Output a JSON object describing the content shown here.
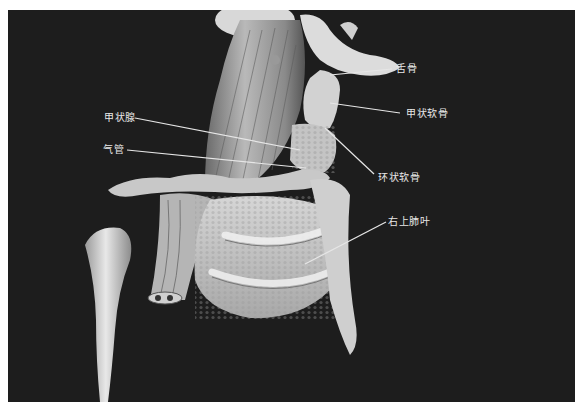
{
  "figure": {
    "background": "#1d1d1d",
    "labels": [
      {
        "id": "hyoid",
        "text": "舌骨"
      },
      {
        "id": "thyroid-cartilage",
        "text": "甲状软骨"
      },
      {
        "id": "cricoid-cartilage",
        "text": "环状软骨"
      },
      {
        "id": "right-upper-lobe",
        "text": "右上肺叶"
      },
      {
        "id": "thyroid-gland",
        "text": "甲状腺"
      },
      {
        "id": "trachea",
        "text": "气管"
      }
    ]
  }
}
